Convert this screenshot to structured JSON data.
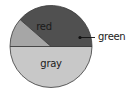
{
  "chart_data": {
    "type": "pie",
    "title": "",
    "categories": [
      "gray",
      "red",
      "green"
    ],
    "values": [
      50,
      38.6,
      11.4
    ],
    "colors": {
      "gray": "#c8c8c8",
      "red": "#505050",
      "green": "#a6a6a6"
    },
    "start_angle_deg": 180,
    "direction": "counterclockwise-from-left-through-bottom",
    "legend": "none",
    "labels": {
      "red": {
        "text": "red",
        "placement": "inside"
      },
      "gray": {
        "text": "gray",
        "placement": "inside"
      },
      "green": {
        "text": "green",
        "placement": "outside-callout"
      }
    }
  },
  "geometry": {
    "cx": 51,
    "cy": 46.5,
    "r": 41,
    "outline_color": "#3a3a3a"
  },
  "labels": {
    "red": "red",
    "gray": "gray",
    "green": "green"
  }
}
